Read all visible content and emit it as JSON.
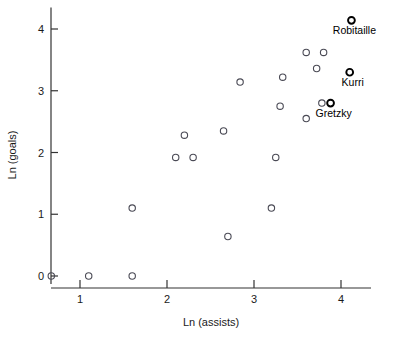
{
  "chart_data": {
    "type": "scatter",
    "title": "",
    "xlabel": "Ln (assists)",
    "ylabel": "Ln (goals)",
    "xlim": [
      0.55,
      4.35
    ],
    "ylim": [
      -0.18,
      4.35
    ],
    "xticks": [
      1,
      2,
      3,
      4
    ],
    "yticks": [
      0,
      1,
      2,
      3,
      4
    ],
    "xtick_labels": [
      "1",
      "2",
      "3",
      "4"
    ],
    "ytick_labels": [
      "0",
      "1",
      "2",
      "3",
      "4"
    ],
    "grid": false,
    "legend": "none",
    "marker": "open-circle",
    "points": [
      {
        "x": 0.67,
        "y": 0.0,
        "label": "",
        "highlight": false
      },
      {
        "x": 1.1,
        "y": 0.0,
        "label": "",
        "highlight": false
      },
      {
        "x": 1.6,
        "y": 0.0,
        "label": "",
        "highlight": false
      },
      {
        "x": 1.6,
        "y": 1.1,
        "label": "",
        "highlight": false
      },
      {
        "x": 2.1,
        "y": 1.92,
        "label": "",
        "highlight": false
      },
      {
        "x": 2.3,
        "y": 1.92,
        "label": "",
        "highlight": false
      },
      {
        "x": 2.2,
        "y": 2.28,
        "label": "",
        "highlight": false
      },
      {
        "x": 2.65,
        "y": 2.35,
        "label": "",
        "highlight": false
      },
      {
        "x": 2.7,
        "y": 0.64,
        "label": "",
        "highlight": false
      },
      {
        "x": 2.84,
        "y": 3.14,
        "label": "",
        "highlight": false
      },
      {
        "x": 3.2,
        "y": 1.1,
        "label": "",
        "highlight": false
      },
      {
        "x": 3.25,
        "y": 1.92,
        "label": "",
        "highlight": false
      },
      {
        "x": 3.3,
        "y": 2.75,
        "label": "",
        "highlight": false
      },
      {
        "x": 3.33,
        "y": 3.22,
        "label": "",
        "highlight": false
      },
      {
        "x": 3.6,
        "y": 2.55,
        "label": "",
        "highlight": false
      },
      {
        "x": 3.6,
        "y": 3.62,
        "label": "",
        "highlight": false
      },
      {
        "x": 3.72,
        "y": 3.36,
        "label": "",
        "highlight": false
      },
      {
        "x": 3.8,
        "y": 3.62,
        "label": "",
        "highlight": false
      },
      {
        "x": 3.78,
        "y": 2.8,
        "label": "",
        "highlight": false
      },
      {
        "x": 3.88,
        "y": 2.8,
        "label": "Gretzky",
        "highlight": true
      },
      {
        "x": 4.1,
        "y": 3.3,
        "label": "Kurri",
        "highlight": true
      },
      {
        "x": 4.12,
        "y": 4.14,
        "label": "Robitaille",
        "highlight": true
      }
    ]
  },
  "colors": {
    "marker_stroke": "#4a4a55",
    "highlight_stroke": "#000000",
    "axis": "#333333",
    "text": "#1a1a1a",
    "background": "#ffffff"
  }
}
